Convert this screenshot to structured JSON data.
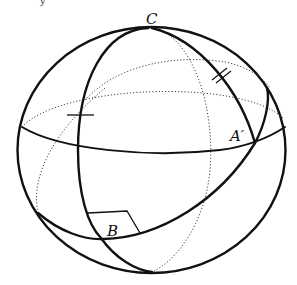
{
  "figure": {
    "top_fragment": "y",
    "labels": {
      "C": "C",
      "A_prime": "A′",
      "B": "B"
    },
    "marks": {
      "single_tick": "equal-length mark (single)",
      "double_tick": "equal-length mark (double)",
      "right_angle": "right angle at B"
    },
    "colors": {
      "stroke": "#111111",
      "dotted": "#444444",
      "background": "#ffffff"
    }
  }
}
